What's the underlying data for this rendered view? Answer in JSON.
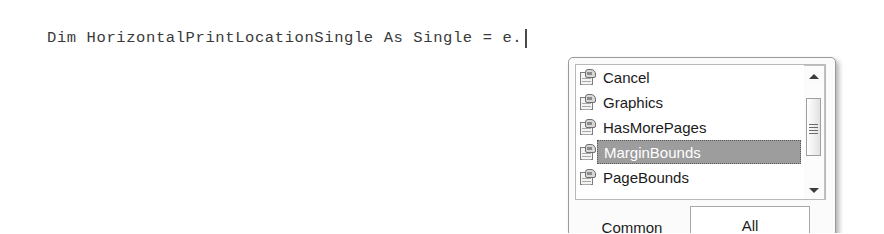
{
  "editor": {
    "code_line": "Dim HorizontalPrintLocationSingle As Single = e.",
    "caret_visible": true
  },
  "intellisense": {
    "items": [
      {
        "label": "Cancel",
        "icon": "property-icon",
        "selected": false
      },
      {
        "label": "Graphics",
        "icon": "property-icon",
        "selected": false
      },
      {
        "label": "HasMorePages",
        "icon": "property-icon",
        "selected": false
      },
      {
        "label": "MarginBounds",
        "icon": "property-icon",
        "selected": true
      },
      {
        "label": "PageBounds",
        "icon": "property-icon",
        "selected": false
      }
    ],
    "scrollbar": {
      "up_icon": "scroll-up-arrow-icon",
      "down_icon": "scroll-down-arrow-icon",
      "thumb_grip_icon": "scrollbar-grip-icon"
    },
    "tabs": [
      {
        "label": "Common",
        "selected": false
      },
      {
        "label": "All",
        "selected": true
      }
    ]
  },
  "colors": {
    "selection_background": "#9d9d9d",
    "selection_text": "#ffffff",
    "code_text": "#3a3a3a",
    "popup_background": "#fbfbfb",
    "popup_border": "#9a9a9a"
  }
}
